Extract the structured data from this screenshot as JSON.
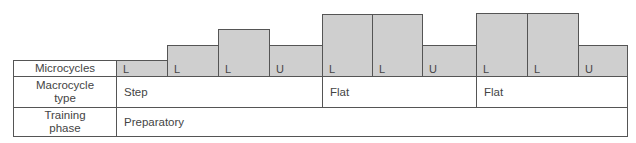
{
  "rows": {
    "microcycles": "Microcycles",
    "macrocycle_type": "Macrocycle type",
    "training_phase": "Training phase"
  },
  "microcycles": [
    {
      "label": "L",
      "level": 1
    },
    {
      "label": "L",
      "level": 2
    },
    {
      "label": "L",
      "level": 3
    },
    {
      "label": "U",
      "level": 2
    },
    {
      "label": "L",
      "level": 4
    },
    {
      "label": "L",
      "level": 4
    },
    {
      "label": "U",
      "level": 2
    },
    {
      "label": "L",
      "level": 4
    },
    {
      "label": "L",
      "level": 4
    },
    {
      "label": "U",
      "level": 2
    }
  ],
  "macrocycles": [
    {
      "label": "Step",
      "span": 4
    },
    {
      "label": "Flat",
      "span": 3
    },
    {
      "label": "Flat",
      "span": 3
    }
  ],
  "training_phase": {
    "label": "Preparatory",
    "span": 10
  },
  "colors": {
    "bar_fill": "#cfcfcf",
    "border": "#555555"
  }
}
